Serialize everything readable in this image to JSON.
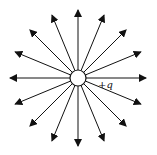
{
  "diagram": {
    "charge_label": "+q",
    "line_count": 16,
    "center": [
      78,
      78
    ],
    "charge_radius": 8,
    "line_length": 68,
    "colors": {
      "line": "#111111",
      "charge_fill": "#ffffff",
      "background": "#ffffff"
    }
  }
}
